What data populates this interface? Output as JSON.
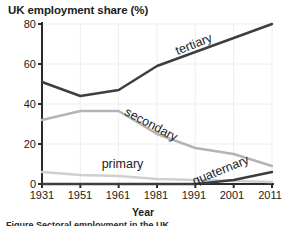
{
  "chart_data": {
    "type": "line",
    "title": "UK employment share (%)",
    "xlabel": "Year",
    "ylabel": "",
    "grid": true,
    "legend": "inline-labels",
    "x": [
      1931,
      1951,
      1961,
      1981,
      1991,
      2001,
      2011
    ],
    "xlim": [
      1931,
      2011
    ],
    "ylim": [
      0,
      80
    ],
    "yticks": [
      0,
      20,
      40,
      60,
      80
    ],
    "xticks": [
      1931,
      1951,
      1961,
      1981,
      1991,
      2001,
      2011
    ],
    "series": [
      {
        "name": "tertiary",
        "color": "#3d3d3d",
        "values": [
          51,
          44,
          47,
          59,
          66,
          73,
          80
        ]
      },
      {
        "name": "secondary",
        "color": "#b4b4b4",
        "values": [
          32,
          36.5,
          36.5,
          25,
          18,
          15,
          9
        ]
      },
      {
        "name": "primary",
        "color": "#cfcfcf",
        "values": [
          6,
          4.5,
          4,
          2.5,
          2,
          1.5,
          1
        ]
      },
      {
        "name": "quaternary",
        "color": "#3d3d3d",
        "values": [
          0,
          0,
          0,
          0,
          0,
          2,
          6
        ]
      }
    ],
    "annotations": [
      {
        "text": "tertiary",
        "x": 1991,
        "y": 68,
        "rotation": -22
      },
      {
        "text": "secondary",
        "x": 1977,
        "y": 28,
        "rotation": 28
      },
      {
        "text": "primary",
        "x": 1963,
        "y": 8,
        "rotation": 0
      },
      {
        "text": "quaternary",
        "x": 1998,
        "y": 5,
        "rotation": -22
      }
    ]
  },
  "caption": {
    "partial_text": "Figure  Sectoral employment in the UK"
  },
  "ticks": {
    "y": [
      "80",
      "60",
      "40",
      "20",
      "0"
    ],
    "x": [
      "1931",
      "1951",
      "1961",
      "1981",
      "1991",
      "2001",
      "2011"
    ]
  }
}
